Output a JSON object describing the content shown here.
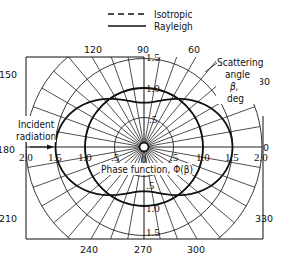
{
  "legend": {
    "items": [
      {
        "label": "Isotropic",
        "style": "dashed"
      },
      {
        "label": "Rayleigh",
        "style": "solid"
      }
    ]
  },
  "axes": {
    "angle_labels": [
      {
        "deg": "0",
        "x": 266,
        "y": 151
      },
      {
        "deg": "30",
        "x": 264,
        "y": 85
      },
      {
        "deg": "60",
        "x": 194,
        "y": 53
      },
      {
        "deg": "90",
        "x": 143,
        "y": 53
      },
      {
        "deg": "120",
        "x": 93,
        "y": 53
      },
      {
        "deg": "150",
        "x": 8,
        "y": 78
      },
      {
        "deg": "180",
        "x": 6,
        "y": 153
      },
      {
        "deg": "210",
        "x": 8,
        "y": 222
      },
      {
        "deg": "240",
        "x": 89,
        "y": 253
      },
      {
        "deg": "270",
        "x": 143,
        "y": 253
      },
      {
        "deg": "300",
        "x": 196,
        "y": 253
      },
      {
        "deg": "330",
        "x": 264,
        "y": 222
      }
    ],
    "radial_labels_horizontal": [
      "2.0",
      "1.5",
      "1.0",
      ".5",
      "0",
      ".5",
      "1.0",
      "1.5",
      "2.0"
    ],
    "radial_labels_vertical_up": [
      "1.5",
      "1.0",
      ".5"
    ],
    "radial_labels_vertical_down": [
      ".5",
      "1.0",
      "1.5"
    ],
    "scattering_angle_label": [
      "Scattering",
      "angle",
      "β,",
      "deg"
    ],
    "incident_label": [
      "Incident",
      "radiation"
    ],
    "phase_function_label": "Phase function,  Φ(β)"
  },
  "chart_data": {
    "type": "polar",
    "title": "",
    "legend": [
      "Isotropic",
      "Rayleigh"
    ],
    "angle_unit": "deg",
    "angle_ticks": [
      0,
      30,
      60,
      90,
      120,
      150,
      180,
      210,
      240,
      270,
      300,
      330
    ],
    "radial_ticks": [
      0,
      0.5,
      1.0,
      1.5,
      2.0
    ],
    "radial_range": [
      0,
      2.0
    ],
    "radial_label": "Phase function, Φ(β)",
    "angular_label": "Scattering angle β, deg",
    "series": [
      {
        "name": "Isotropic",
        "formula": "Φ(β)=1",
        "values_at_ticks": [
          1,
          1,
          1,
          1,
          1,
          1,
          1,
          1,
          1,
          1,
          1,
          1
        ]
      },
      {
        "name": "Rayleigh",
        "formula": "Φ(β)=0.75(1+cos²β)",
        "values_at_ticks": [
          1.5,
          1.3125,
          0.9375,
          0.75,
          0.9375,
          1.3125,
          1.5,
          1.3125,
          0.9375,
          0.75,
          0.9375,
          1.3125
        ]
      }
    ],
    "grid": true,
    "annotations": [
      "Incident radiation (arrow along 180°)"
    ]
  }
}
